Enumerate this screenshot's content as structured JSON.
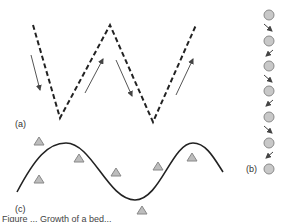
{
  "panels": {
    "a": {
      "label": "(a)"
    },
    "b": {
      "label": "(b)"
    },
    "c": {
      "label": "(c)"
    }
  },
  "caption": "Figure ...  Growth of a bed...",
  "colors": {
    "line": "#222222",
    "arrow": "#444444",
    "marker_fill": "#bdbdbd",
    "marker_stroke": "#888888"
  }
}
